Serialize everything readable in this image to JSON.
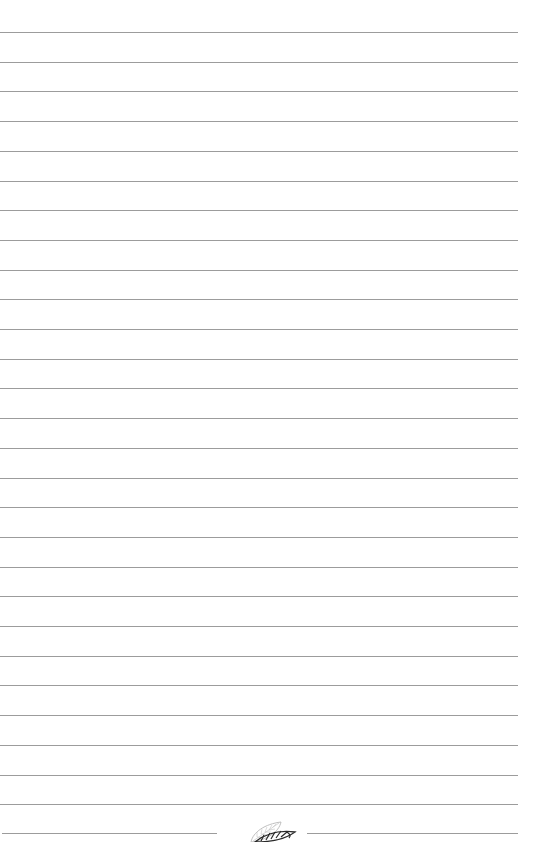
{
  "page": {
    "type": "lined-notebook-page",
    "background_color": "#ffffff",
    "line_color": "#9c9c9c",
    "line_count": 27,
    "first_line_y": 32,
    "line_spacing": 29.7,
    "line_width": 518
  },
  "footer": {
    "split_line_y": 833,
    "left_segment": {
      "x": 2,
      "width": 215
    },
    "right_segment": {
      "x": 307,
      "width": 211
    },
    "ornament": {
      "icon": "leaf-icon",
      "description": "two stylized leaves, one light outline and one dark hatched"
    }
  }
}
